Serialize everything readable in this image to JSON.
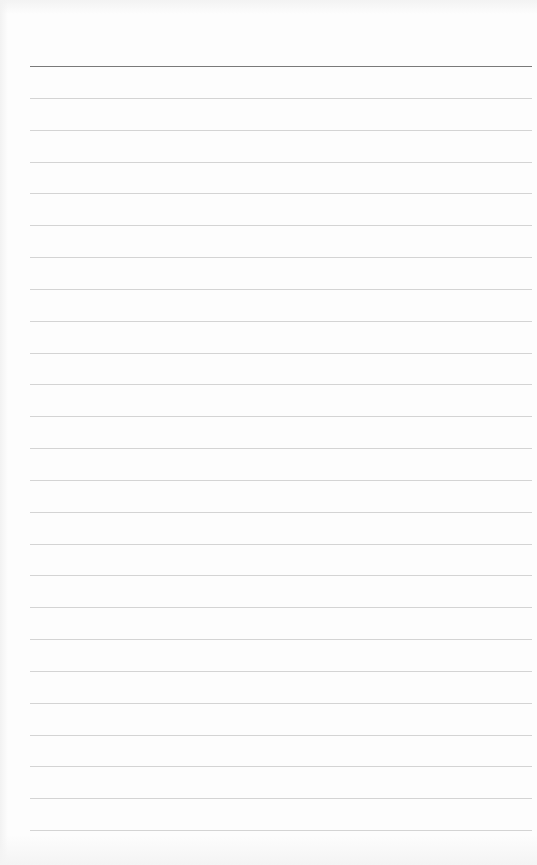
{
  "page": {
    "type": "lined-paper",
    "line_count": 25,
    "colors": {
      "paper": "#fdfdfd",
      "header_rule": "#7a7a7a",
      "ruled_line": "#d4d4d4"
    }
  }
}
